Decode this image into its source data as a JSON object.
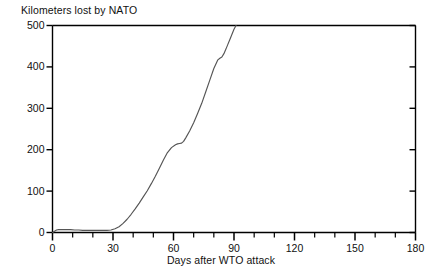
{
  "chart_data": {
    "type": "line",
    "title": "Kilometers lost by NATO",
    "xlabel": "Days after WTO attack",
    "ylabel": "",
    "xlim": [
      0,
      180
    ],
    "ylim": [
      0,
      500
    ],
    "grid": false,
    "legend": "none",
    "xticks": [
      0,
      30,
      60,
      90,
      120,
      150,
      180
    ],
    "xtick_labels": [
      "0",
      "30",
      "60",
      "90",
      "120",
      "150",
      "180"
    ],
    "x_minor_tick_interval": 10,
    "yticks": [
      0,
      100,
      200,
      300,
      400,
      500
    ],
    "ytick_labels": [
      "0",
      "100",
      "200",
      "300",
      "400",
      "500"
    ],
    "line_color": "#555555",
    "axis_color": "#000000",
    "series": [
      {
        "name": "Kilometers lost by NATO",
        "x": [
          0,
          1,
          2,
          3,
          4,
          5,
          7,
          9,
          11,
          13,
          15,
          17,
          19,
          21,
          23,
          25,
          27,
          29,
          31,
          33,
          35,
          37,
          39,
          41,
          43,
          45,
          47,
          49,
          51,
          53,
          55,
          57,
          59,
          61,
          62,
          63,
          64,
          65,
          66,
          68,
          70,
          72,
          74,
          76,
          78,
          80,
          82,
          83,
          84,
          85,
          86,
          87,
          88,
          89,
          90,
          91
        ],
        "y": [
          0,
          3,
          6,
          7,
          7,
          7,
          7,
          7,
          6,
          6,
          5,
          5,
          5,
          5,
          5,
          5,
          5,
          6,
          9,
          14,
          22,
          32,
          44,
          57,
          71,
          86,
          101,
          118,
          136,
          155,
          175,
          193,
          205,
          212,
          214,
          215,
          216,
          220,
          228,
          245,
          265,
          288,
          312,
          340,
          368,
          396,
          417,
          421,
          424,
          432,
          443,
          455,
          467,
          479,
          491,
          500
        ]
      }
    ]
  },
  "axes": {
    "title_position": "top-left",
    "frame": "box"
  }
}
